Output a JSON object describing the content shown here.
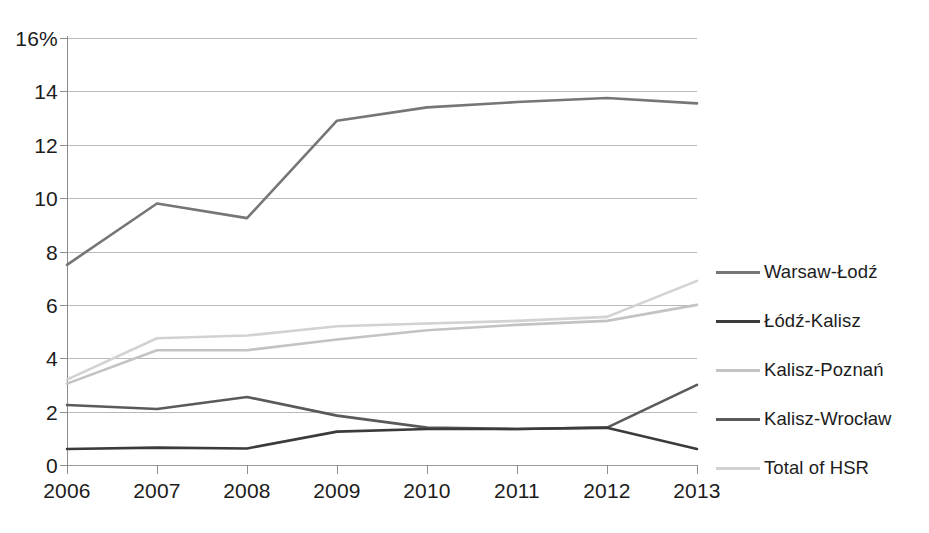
{
  "chart_data": {
    "type": "line",
    "title": "",
    "subtitle": "",
    "xlabel": "",
    "ylabel": "",
    "categories": [
      "2006",
      "2007",
      "2008",
      "2009",
      "2010",
      "2011",
      "2012",
      "2013"
    ],
    "x": [
      2006,
      2007,
      2008,
      2009,
      2010,
      2011,
      2012,
      2013
    ],
    "ylim": [
      0,
      16
    ],
    "xlim": [
      2006,
      2013
    ],
    "y_tick_labels": [
      "16%",
      "14",
      "12",
      "10",
      "8",
      "6",
      "4",
      "2",
      "0"
    ],
    "y_ticks": [
      16,
      14,
      12,
      10,
      8,
      6,
      4,
      2,
      0
    ],
    "y_axis_unit": "%",
    "grid": "horizontal",
    "legend_position": "right",
    "series": [
      {
        "name": "Warsaw-Łodź",
        "color": "#767676",
        "values": [
          7.5,
          9.8,
          9.25,
          12.9,
          13.4,
          13.6,
          13.75,
          13.55
        ]
      },
      {
        "name": "Łódź-Kalisz",
        "color": "#3b3b3b",
        "values": [
          0.6,
          0.65,
          0.62,
          1.25,
          1.35,
          1.35,
          1.4,
          0.6
        ]
      },
      {
        "name": "Kalisz-Poznań",
        "color": "#c3c3c3",
        "values": [
          3.05,
          4.3,
          4.3,
          4.7,
          5.05,
          5.25,
          5.4,
          6.0
        ]
      },
      {
        "name": "Kalisz-Wrocław",
        "color": "#5a5a5a",
        "values": [
          2.25,
          2.1,
          2.55,
          1.85,
          1.4,
          1.35,
          1.4,
          3.0
        ]
      },
      {
        "name": "Total of HSR",
        "color": "#d2d2d2",
        "values": [
          3.2,
          4.75,
          4.85,
          5.2,
          5.3,
          5.4,
          5.55,
          6.9
        ]
      }
    ]
  },
  "legend": {
    "items": [
      {
        "label": "Warsaw-Łodź"
      },
      {
        "label": "Łódź-Kalisz"
      },
      {
        "label": "Kalisz-Poznań"
      },
      {
        "label": "Kalisz-Wrocław"
      },
      {
        "label": "Total of HSR"
      }
    ]
  },
  "axes": {
    "y_labels": [
      "16%",
      "14",
      "12",
      "10",
      "8",
      "6",
      "4",
      "2",
      "0"
    ],
    "x_labels": [
      "2006",
      "2007",
      "2008",
      "2009",
      "2010",
      "2011",
      "2012",
      "2013"
    ]
  },
  "colors": {
    "gridline": "#b9b9b9",
    "axis": "#8d8d8d",
    "text": "#1c1c1c",
    "background": "#ffffff"
  }
}
